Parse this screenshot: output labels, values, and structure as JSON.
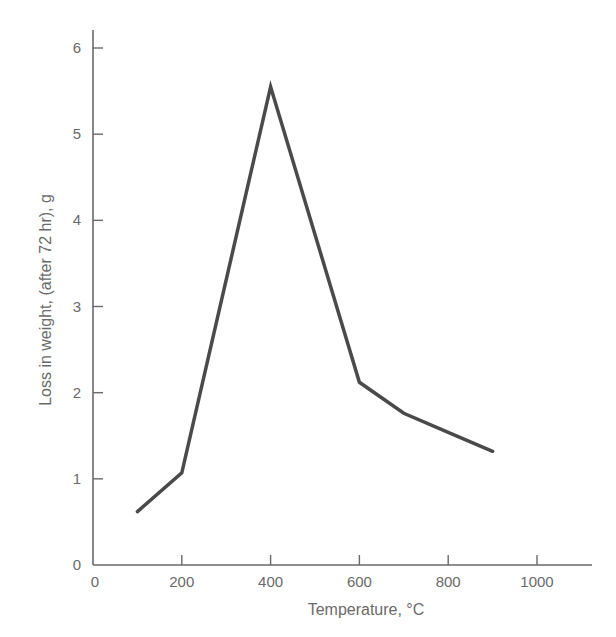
{
  "chart_data": {
    "type": "line",
    "title": "",
    "xlabel": "Temperature, °C",
    "ylabel": "Loss in weight, (after 72 hr), g",
    "x": [
      100,
      200,
      400,
      600,
      700,
      800,
      900
    ],
    "series": [
      {
        "name": "Loss in weight",
        "values": [
          0.62,
          1.07,
          5.55,
          2.12,
          1.76,
          1.54,
          1.32
        ]
      }
    ],
    "xlim": [
      0,
      1150
    ],
    "ylim": [
      0,
      6.2
    ],
    "xticks": [
      0,
      200,
      400,
      600,
      800,
      1000
    ],
    "yticks": [
      0,
      1,
      2,
      3,
      4,
      5,
      6
    ],
    "xtick_labels": [
      "0",
      "200",
      "400",
      "600",
      "800",
      "1000"
    ],
    "ytick_labels": [
      "0",
      "1",
      "2",
      "3",
      "4",
      "5",
      "6"
    ],
    "grid": false,
    "legend": null,
    "line_color": "#4a4a4a",
    "axis_color": "#6a6a6a"
  }
}
